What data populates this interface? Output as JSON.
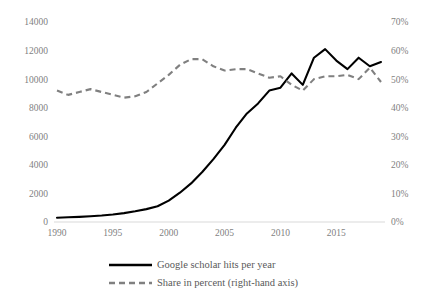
{
  "chart_data": {
    "type": "line",
    "title": "",
    "subtitle": "",
    "xlabel": "",
    "ylabel": "",
    "y2label": "",
    "grid": false,
    "legend_position": "bottom",
    "x": [
      1990,
      1991,
      1992,
      1993,
      1994,
      1995,
      1996,
      1997,
      1998,
      1999,
      2000,
      2001,
      2002,
      2003,
      2004,
      2005,
      2006,
      2007,
      2008,
      2009,
      2010,
      2011,
      2012,
      2013,
      2014,
      2015,
      2016,
      2017,
      2018,
      2019
    ],
    "xlim": [
      1990,
      2019
    ],
    "xticks": [
      1990,
      1995,
      2000,
      2005,
      2010,
      2015
    ],
    "xtick_labels": [
      "1990",
      "1995",
      "2000",
      "2005",
      "2010",
      "2015"
    ],
    "ylim": [
      0,
      14000
    ],
    "yticks": [
      0,
      2000,
      4000,
      6000,
      8000,
      10000,
      12000,
      14000
    ],
    "ytick_labels": [
      "0",
      "2000",
      "4000",
      "6000",
      "8000",
      "10000",
      "12000",
      "14000"
    ],
    "y2lim": [
      0,
      70
    ],
    "y2ticks": [
      0,
      10,
      20,
      30,
      40,
      50,
      60,
      70
    ],
    "y2tick_labels": [
      "0%",
      "10%",
      "20%",
      "30%",
      "40%",
      "50%",
      "60%",
      "70%"
    ],
    "series": [
      {
        "name": "Google scholar hits per year",
        "axis": "left",
        "style": "solid",
        "color": "#000000",
        "values": [
          300,
          330,
          360,
          400,
          450,
          520,
          620,
          750,
          900,
          1100,
          1500,
          2050,
          2700,
          3500,
          4400,
          5400,
          6600,
          7600,
          8300,
          9200,
          9400,
          10400,
          9600,
          11500,
          12100,
          11300,
          10700,
          11500,
          10900,
          11200
        ]
      },
      {
        "name": "Share in percent (right-hand axis)",
        "axis": "right",
        "style": "dashed",
        "color": "#808080",
        "values": [
          46,
          44.5,
          45.5,
          46.5,
          45.5,
          44.5,
          43.5,
          44,
          45.5,
          48.5,
          51.5,
          55,
          57,
          57,
          54.5,
          53,
          53.5,
          53.5,
          52,
          50.5,
          51,
          48,
          46,
          50,
          51,
          51,
          51.5,
          50,
          54,
          49
        ]
      }
    ],
    "legend": [
      {
        "label": "Google scholar hits per year",
        "style": "solid",
        "color": "#000000"
      },
      {
        "label": "Share in percent (right-hand axis)",
        "style": "dashed",
        "color": "#808080"
      }
    ],
    "colors": {
      "solid_series": "#000000",
      "dashed_series": "#808080",
      "axis": "#d9d9d9",
      "tick_text": "#7f7f7f",
      "legend_text": "#595959",
      "background": "#ffffff"
    }
  }
}
